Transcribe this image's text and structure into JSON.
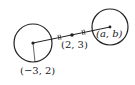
{
  "diagram": {
    "left_circle": {
      "cx": 33,
      "cy": 43,
      "r": 19,
      "label": "(−3, 2)"
    },
    "right_circle": {
      "cx": 110,
      "cy": 27,
      "r": 18,
      "label": "(a, b)"
    },
    "midpoint": {
      "x": 72,
      "y": 35,
      "label": "(2, 3)"
    },
    "colors": {
      "stroke": "#222222",
      "background": "#ffffff"
    }
  }
}
